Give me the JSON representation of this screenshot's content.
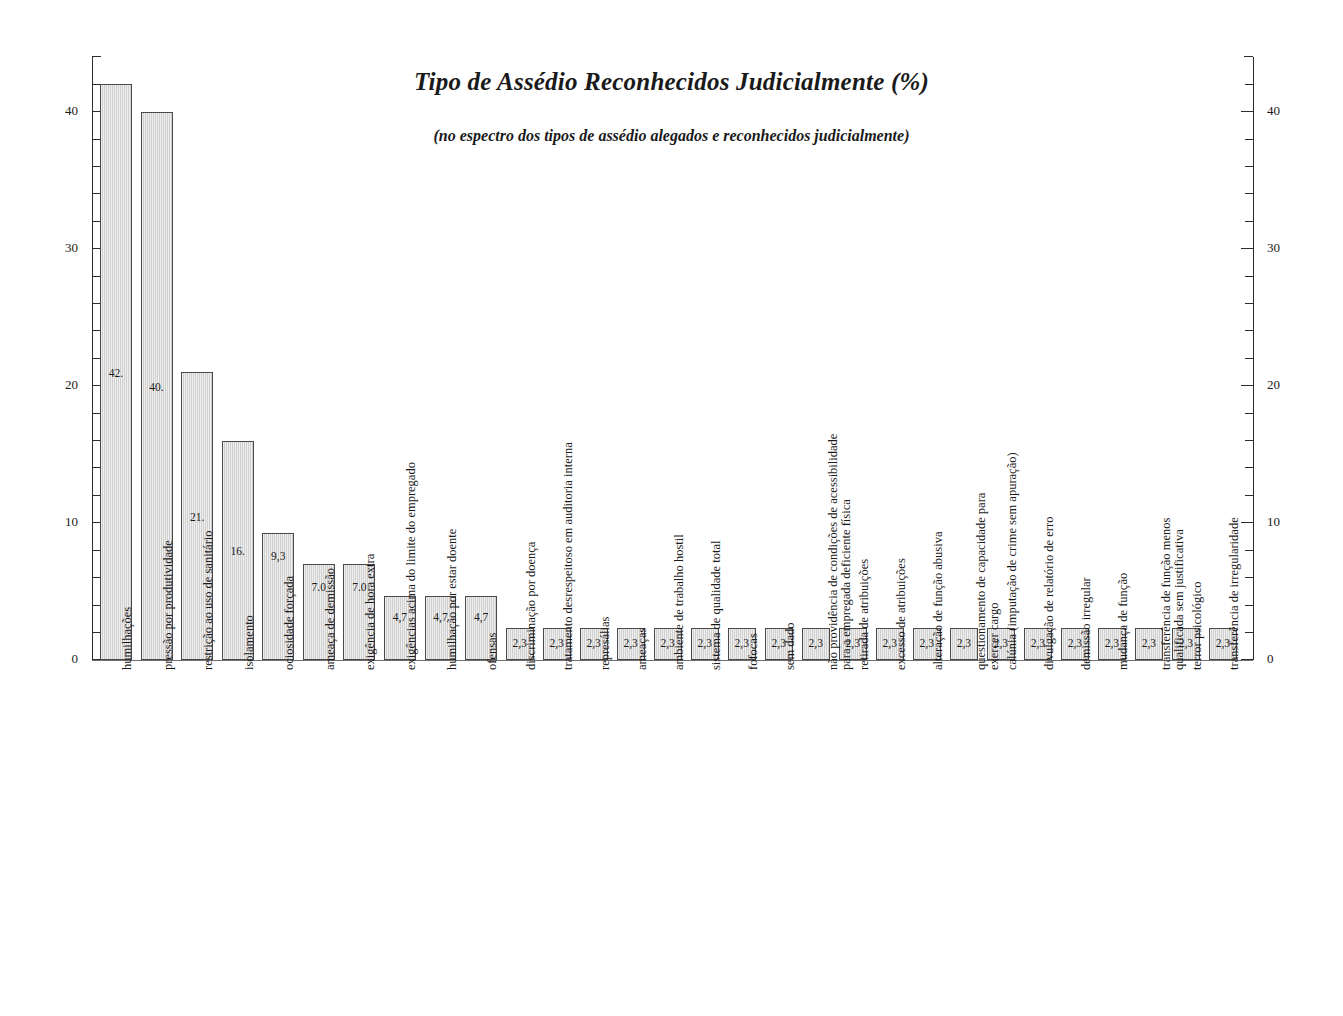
{
  "chart_data": {
    "type": "bar",
    "title": "Tipo de Assédio Reconhecidos Judicialmente (%)",
    "subtitle": "(no espectro dos tipos de assédio alegados e reconhecidos judicialmente)",
    "xlabel": "",
    "ylabel": "",
    "ylim": [
      0,
      44
    ],
    "ytick_labels": [
      "0",
      "10",
      "20",
      "30",
      "40"
    ],
    "ytick_values": [
      0,
      10,
      20,
      30,
      40
    ],
    "minor_tick_step": 2,
    "grid": false,
    "legend": "none",
    "axes": "dual y-axis (left and right, identical scale)",
    "bar_fill": "#dcdcdc",
    "bar_border": "#4a4a4a",
    "categories": [
      "humilhações",
      "pressão por produtividade",
      "restrição ao uso de sanitário",
      "isolamento",
      "ociosidade forçada",
      "ameaça de demissão",
      "exigência de hora extra",
      "exigências acima do limite do empregado",
      "humilhação por estar doente",
      "ofensas",
      "discriminação por doença",
      "tratamento desrespeitoso em auditoria interna",
      "represálias",
      "ameaças",
      "ambiente de trabalho hostil",
      "sistema de qualidade total",
      "fofocas",
      "sem dado",
      "não providência de condições de acessibilidade para a empregada deficiente física",
      "retirada de atribuições",
      "excesso de atribuições",
      "alteração de função abusiva",
      "questionamento de capacidade para exercer cargo",
      "calúnia (imputação de crime sem apuração)",
      "divulgação de relatório de erro",
      "demissão irregular",
      "mudança de função",
      "transferência de função menos qualificada sem justificativa",
      "terror psicológico",
      "transferência de irregularidade"
    ],
    "values": [
      42.0,
      40.0,
      21.0,
      16.0,
      9.3,
      7.0,
      7.0,
      4.7,
      4.7,
      4.7,
      2.3,
      2.3,
      2.3,
      2.3,
      2.3,
      2.3,
      2.3,
      2.3,
      2.3,
      2.3,
      2.3,
      2.3,
      2.3,
      2.3,
      2.3,
      2.3,
      2.3,
      2.3,
      2.3,
      2.3
    ],
    "value_labels": [
      "42.",
      "40.",
      "21.",
      "16.",
      "9,3",
      "7.0",
      "7.0",
      "4,7",
      "4,7",
      "4,7",
      "2,3",
      "2,3",
      "2,3",
      "2,3",
      "2,3",
      "2,3",
      "2,3",
      "2,3",
      "2,3",
      "2,3",
      "2,3",
      "2,3",
      "2,3",
      "2,3",
      "2,3",
      "2,3",
      "2,3",
      "2,3",
      "2,3",
      "2,3"
    ]
  }
}
